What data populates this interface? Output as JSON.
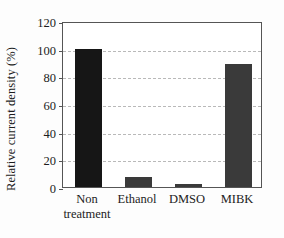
{
  "chart_data": {
    "type": "bar",
    "title": "",
    "subtitle": "",
    "xlabel": "",
    "ylabel": "Relative current density (%)",
    "categories": [
      "Non\ntreatment",
      "Ethanol",
      "DMSO",
      "MIBK"
    ],
    "values": [
      100,
      7.5,
      2,
      89
    ],
    "ylim": [
      0,
      120
    ],
    "ytick_values": [
      0,
      20,
      40,
      60,
      80,
      100,
      120
    ],
    "ytick_labels": [
      "0",
      "20",
      "40",
      "60",
      "80",
      "100",
      "120"
    ],
    "grid": "horizontal-dashed",
    "legend": "none",
    "bar_colors": [
      "#161616",
      "#3a3a3a",
      "#3a3a3a",
      "#3a3a3a"
    ],
    "annotations": []
  },
  "axis": {
    "y_title": "Relative current density (%)",
    "tick_0": "0",
    "tick_20": "20",
    "tick_40": "40",
    "tick_60": "60",
    "tick_80": "80",
    "tick_100": "100",
    "tick_120": "120"
  },
  "categories": {
    "c0": "Non\ntreatment",
    "c1": "Ethanol",
    "c2": "DMSO",
    "c3": "MIBK"
  },
  "colors": {
    "background": "#fdfdfd",
    "plot_background": "#ffffff",
    "frame": "#555555",
    "gridline": "#b9b9b9",
    "bar_primary": "#161616",
    "bar_secondary": "#3a3a3a",
    "text": "#1c1c1c"
  }
}
